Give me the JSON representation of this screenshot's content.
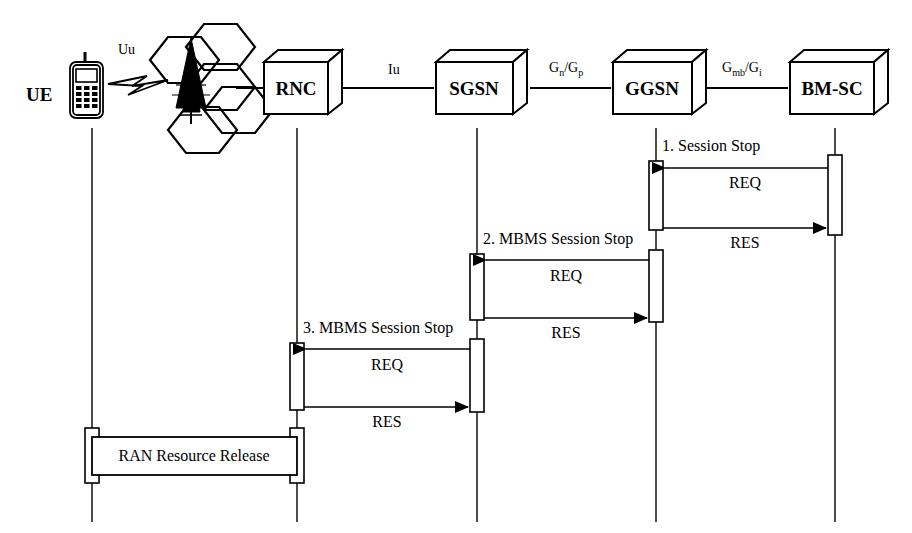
{
  "diagram": {
    "type": "sequence-diagram",
    "nodes": [
      {
        "id": "ue",
        "label": "UE",
        "icon": "mobile-phone-icon",
        "lifeline_x": 92
      },
      {
        "id": "rnc",
        "label": "RNC",
        "icon": "network-node-box",
        "lifeline_x": 297
      },
      {
        "id": "sgsn",
        "label": "SGSN",
        "icon": "network-node-box",
        "lifeline_x": 477
      },
      {
        "id": "ggsn",
        "label": "GGSN",
        "icon": "network-node-box",
        "lifeline_x": 656
      },
      {
        "id": "bmsc",
        "label": "BM-SC",
        "icon": "network-node-box",
        "lifeline_x": 835
      }
    ],
    "radio_access": {
      "cell_cluster_icon": "hexagon-cell-cluster-icon",
      "tower_icon": "cell-tower-icon",
      "radio_link_icon": "radio-lightning-icon"
    },
    "interfaces": [
      {
        "id": "uu",
        "label": "Uu",
        "sub1": "",
        "sep": "",
        "label2": "",
        "sub2": ""
      },
      {
        "id": "iu",
        "label": "Iu",
        "sub1": "",
        "sep": "",
        "label2": "",
        "sub2": ""
      },
      {
        "id": "gngp",
        "label": "G",
        "sub1": "n",
        "sep": "/",
        "label2": "G",
        "sub2": "p"
      },
      {
        "id": "gmbgi",
        "label": "G",
        "sub1": "mb",
        "sep": "/",
        "label2": "G",
        "sub2": "i"
      }
    ],
    "messages": [
      {
        "step": "1",
        "title": "1. Session Stop",
        "request_label": "REQ",
        "response_label": "RES",
        "from": "bmsc",
        "to": "ggsn",
        "request_direction": "right-to-left",
        "response_direction": "left-to-right"
      },
      {
        "step": "2",
        "title": "2. MBMS Session Stop",
        "request_label": "REQ",
        "response_label": "RES",
        "from": "ggsn",
        "to": "sgsn",
        "request_direction": "right-to-left",
        "response_direction": "left-to-right"
      },
      {
        "step": "3",
        "title": "3. MBMS Session Stop",
        "request_label": "REQ",
        "response_label": "RES",
        "from": "sgsn",
        "to": "rnc",
        "request_direction": "right-to-left",
        "response_direction": "left-to-right"
      }
    ],
    "procedure_box": {
      "label": "RAN Resource Release",
      "from": "ue",
      "to": "rnc"
    },
    "colors": {
      "line": "#000000",
      "fill": "#ffffff",
      "background": "#ffffff"
    }
  }
}
